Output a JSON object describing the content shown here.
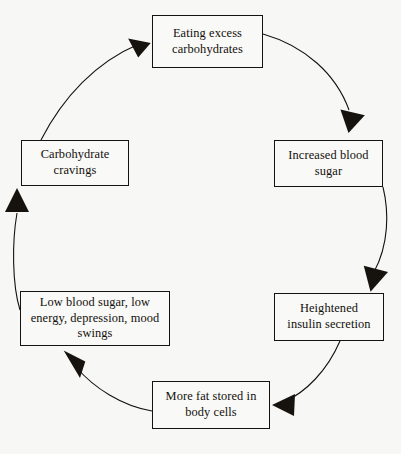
{
  "diagram": {
    "type": "cycle-flowchart",
    "direction": "clockwise",
    "background_color": "#f7f7f5",
    "line_color": "#16130f",
    "text_color": "#120f0c",
    "nodes": [
      {
        "id": "eating",
        "label": "Eating excess\ncarbohydrates"
      },
      {
        "id": "increased",
        "label": "Increased blood\nsugar"
      },
      {
        "id": "heightened",
        "label": "Heightened\ninsulin secretion"
      },
      {
        "id": "morefat",
        "label": "More fat stored in\nbody cells"
      },
      {
        "id": "lowblood",
        "label": "Low blood sugar, low\nenergy, depression, mood\nswings"
      },
      {
        "id": "cravings",
        "label": "Carbohydrate\ncravings"
      }
    ],
    "edges": [
      {
        "id": "edge-eating-to-increased",
        "from": "Eating excess carbohydrates",
        "to": "Increased blood sugar"
      },
      {
        "id": "edge-increased-to-heightened",
        "from": "Increased blood sugar",
        "to": "Heightened insulin secretion"
      },
      {
        "id": "edge-heightened-to-morefat",
        "from": "Heightened insulin secretion",
        "to": "More fat stored in body cells"
      },
      {
        "id": "edge-morefat-to-lowblood",
        "from": "More fat stored in body cells",
        "to": "Low blood sugar, low energy, depression, mood swings"
      },
      {
        "id": "edge-lowblood-to-cravings",
        "from": "Low blood sugar, low energy, depression, mood swings",
        "to": "Carbohydrate cravings"
      },
      {
        "id": "edge-cravings-to-eating",
        "from": "Carbohydrate cravings",
        "to": "Eating excess carbohydrates"
      }
    ]
  }
}
